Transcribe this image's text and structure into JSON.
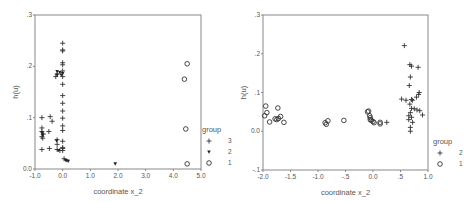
{
  "chart_data": [
    {
      "type": "scatter",
      "title": "",
      "xlabel": "coordinate x_2",
      "ylabel": "h(u)",
      "xlim": [
        -1.0,
        5.0
      ],
      "ylim": [
        0.0,
        0.3
      ],
      "xticks": [
        "-1.0",
        "0.0",
        "1.0",
        "2.0",
        "3.0",
        "4.0",
        "5.0"
      ],
      "yticks": [
        "0.0",
        ".1",
        ".2",
        ".3"
      ],
      "grid": false,
      "legend": {
        "title": "group",
        "position": "right-bottom",
        "entries": [
          {
            "label": "3",
            "marker": "plus"
          },
          {
            "label": "2",
            "marker": "triangle-down-filled"
          },
          {
            "label": "1",
            "marker": "circle-open"
          }
        ]
      },
      "series": [
        {
          "name": "3",
          "marker": "plus",
          "points": [
            [
              0.0,
              0.245
            ],
            [
              0.0,
              0.232
            ],
            [
              0.0,
              0.23
            ],
            [
              0.0,
              0.207
            ],
            [
              0.0,
              0.203
            ],
            [
              0.0,
              0.191
            ],
            [
              0.0,
              0.18
            ],
            [
              0.0,
              0.165
            ],
            [
              0.0,
              0.143
            ],
            [
              0.0,
              0.128
            ],
            [
              0.0,
              0.113
            ],
            [
              0.0,
              0.099
            ],
            [
              0.0,
              0.084
            ],
            [
              0.0,
              0.075
            ],
            [
              0.0,
              0.054
            ],
            [
              0.0,
              0.042
            ],
            [
              0.0,
              0.036
            ],
            [
              0.05,
              0.02
            ],
            [
              -0.2,
              0.185
            ],
            [
              -0.25,
              0.18
            ],
            [
              -0.75,
              0.1
            ],
            [
              -0.45,
              0.102
            ],
            [
              -0.38,
              0.093
            ],
            [
              -0.75,
              0.08
            ],
            [
              -0.5,
              0.073
            ],
            [
              -0.75,
              0.073
            ],
            [
              -0.7,
              0.068
            ],
            [
              -0.75,
              0.063
            ],
            [
              -0.72,
              0.06
            ],
            [
              -0.2,
              0.057
            ],
            [
              -0.2,
              0.048
            ],
            [
              -0.75,
              0.038
            ],
            [
              -0.48,
              0.04
            ],
            [
              -0.2,
              0.038
            ],
            [
              -0.1,
              0.036
            ],
            [
              0.0,
              0.04
            ]
          ]
        },
        {
          "name": "2",
          "marker": "triangle-down-filled",
          "points": [
            [
              -0.2,
              0.19
            ],
            [
              -0.1,
              0.188
            ],
            [
              -0.05,
              0.183
            ],
            [
              -0.2,
              0.183
            ],
            [
              0.0,
              0.186
            ],
            [
              -0.72,
              0.066
            ],
            [
              -0.75,
              0.07
            ],
            [
              -0.22,
              0.055
            ],
            [
              -0.15,
              0.036
            ],
            [
              0.1,
              0.017
            ],
            [
              0.15,
              0.016
            ],
            [
              0.2,
              0.015
            ],
            [
              1.9,
              0.01
            ]
          ]
        },
        {
          "name": "1",
          "marker": "circle-open",
          "points": [
            [
              4.5,
              0.205
            ],
            [
              4.4,
              0.175
            ],
            [
              4.45,
              0.078
            ],
            [
              4.5,
              0.01
            ]
          ]
        }
      ]
    },
    {
      "type": "scatter",
      "title": "",
      "xlabel": "coordinate x_2",
      "ylabel": "h(u)",
      "xlim": [
        -2.0,
        1.0
      ],
      "ylim": [
        -0.1,
        0.3
      ],
      "xticks": [
        "-2.0",
        "-1.5",
        "-1.0",
        "-.5",
        "0.0",
        ".5",
        "1.0"
      ],
      "yticks": [
        "-.1",
        "0.0",
        ".1",
        ".2",
        ".3"
      ],
      "grid": false,
      "legend": {
        "title": "group",
        "position": "right-bottom",
        "entries": [
          {
            "label": "2",
            "marker": "plus"
          },
          {
            "label": "1",
            "marker": "circle-open"
          }
        ]
      },
      "series": [
        {
          "name": "2",
          "marker": "plus",
          "points": [
            [
              0.57,
              0.221
            ],
            [
              0.67,
              0.172
            ],
            [
              0.7,
              0.168
            ],
            [
              0.82,
              0.165
            ],
            [
              0.68,
              0.14
            ],
            [
              0.66,
              0.118
            ],
            [
              0.84,
              0.1
            ],
            [
              0.83,
              0.095
            ],
            [
              0.79,
              0.088
            ],
            [
              0.52,
              0.083
            ],
            [
              0.6,
              0.08
            ],
            [
              0.7,
              0.082
            ],
            [
              0.72,
              0.08
            ],
            [
              0.67,
              0.07
            ],
            [
              0.7,
              0.059
            ],
            [
              0.75,
              0.058
            ],
            [
              0.8,
              0.055
            ],
            [
              0.85,
              0.053
            ],
            [
              0.68,
              0.048
            ],
            [
              0.9,
              0.042
            ],
            [
              0.65,
              0.04
            ],
            [
              0.7,
              0.036
            ],
            [
              0.65,
              0.03
            ],
            [
              0.72,
              0.023
            ],
            [
              0.68,
              0.01
            ],
            [
              0.68,
              0.0
            ],
            [
              0.25,
              0.023
            ]
          ]
        },
        {
          "name": "1",
          "marker": "circle-open",
          "points": [
            [
              -1.95,
              0.065
            ],
            [
              -1.93,
              0.048
            ],
            [
              -1.97,
              0.04
            ],
            [
              -1.88,
              0.024
            ],
            [
              -1.73,
              0.06
            ],
            [
              -1.78,
              0.032
            ],
            [
              -1.75,
              0.03
            ],
            [
              -1.72,
              0.033
            ],
            [
              -1.68,
              0.038
            ],
            [
              -1.62,
              0.023
            ],
            [
              -0.87,
              0.022
            ],
            [
              -0.85,
              0.018
            ],
            [
              -0.82,
              0.027
            ],
            [
              -0.53,
              0.028
            ],
            [
              -0.08,
              0.052
            ],
            [
              -0.1,
              0.05
            ],
            [
              -0.06,
              0.04
            ],
            [
              -0.05,
              0.035
            ],
            [
              -0.05,
              0.03
            ],
            [
              -0.03,
              0.028
            ],
            [
              0.0,
              0.025
            ],
            [
              0.02,
              0.022
            ],
            [
              0.13,
              0.023
            ],
            [
              0.13,
              0.019
            ]
          ]
        }
      ]
    }
  ]
}
